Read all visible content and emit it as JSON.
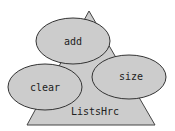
{
  "diagram": {
    "class_node": {
      "label": "ListsHrc",
      "shape": "triangle"
    },
    "method_nodes": [
      {
        "id": "add",
        "label": "add",
        "shape": "ellipse"
      },
      {
        "id": "clear",
        "label": "clear",
        "shape": "ellipse"
      },
      {
        "id": "size",
        "label": "size",
        "shape": "ellipse"
      }
    ],
    "colors": {
      "fill": "#cccccc",
      "stroke": "#333333",
      "text": "#222222",
      "background": "#ffffff"
    }
  }
}
